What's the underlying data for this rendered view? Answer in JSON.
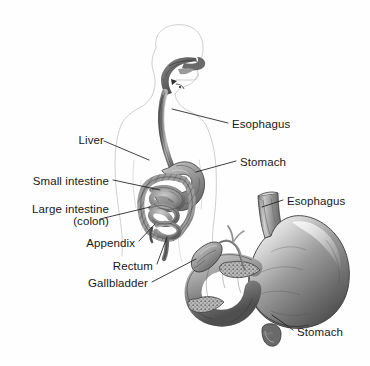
{
  "figure": {
    "background_color": "#fefefe",
    "ink_color": "#181818",
    "outline_color": "#c9c9c9",
    "width": 370,
    "height": 366,
    "signature": "Flom"
  },
  "labels": [
    {
      "id": "esophagus-upper",
      "text": "Esophagus",
      "x": 232,
      "y": 118
    },
    {
      "id": "liver",
      "text": "Liver",
      "x": 74,
      "y": 139
    },
    {
      "id": "stomach-upper",
      "text": "Stomach",
      "x": 240,
      "y": 157
    },
    {
      "id": "small-intestine",
      "text": "Small intestine",
      "x": 14,
      "y": 177
    },
    {
      "id": "large-intestine",
      "text": "Large intestine",
      "x": 13,
      "y": 205
    },
    {
      "id": "colon",
      "text": "(colon)",
      "x": 48,
      "y": 217
    },
    {
      "id": "esophagus-lower",
      "text": "Esophagus",
      "x": 287,
      "y": 196
    },
    {
      "id": "appendix",
      "text": "Appendix",
      "x": 81,
      "y": 239
    },
    {
      "id": "rectum",
      "text": "Rectum",
      "x": 116,
      "y": 263
    },
    {
      "id": "gallbladder",
      "text": "Gallbladder",
      "x": 91,
      "y": 281
    },
    {
      "id": "stomach-lower",
      "text": "Stomach",
      "x": 297,
      "y": 327
    }
  ],
  "leader_lines": [
    {
      "id": "leader-esophagus-upper",
      "from": [
        228,
        123
      ],
      "to": [
        172,
        109
      ]
    },
    {
      "id": "leader-liver",
      "from": [
        104,
        144
      ],
      "to": [
        149,
        160
      ]
    },
    {
      "id": "leader-stomach-upper",
      "from": [
        236,
        162
      ],
      "to": [
        196,
        172
      ]
    },
    {
      "id": "leader-small-intestine",
      "from": [
        113,
        182
      ],
      "to": [
        160,
        190
      ]
    },
    {
      "id": "leader-large-intestine",
      "from": [
        100,
        220
      ],
      "to": [
        150,
        208
      ]
    },
    {
      "id": "leader-esophagus-lower",
      "from": [
        283,
        201
      ],
      "to": [
        262,
        207
      ]
    },
    {
      "id": "leader-appendix",
      "from": [
        139,
        242
      ],
      "to": [
        155,
        224
      ]
    },
    {
      "id": "leader-rectum",
      "from": [
        157,
        265
      ],
      "to": [
        166,
        236
      ]
    },
    {
      "id": "leader-gallbladder",
      "from": [
        152,
        283
      ],
      "to": [
        196,
        259
      ]
    },
    {
      "id": "leader-stomach-lower",
      "from": [
        293,
        331
      ],
      "to": [
        272,
        316
      ]
    }
  ],
  "organs": [
    {
      "id": "body-outline",
      "name": "human head, neck and torso silhouette"
    },
    {
      "id": "mouth-pharynx",
      "name": "mouth and pharynx"
    },
    {
      "id": "esophagus-tube",
      "name": "esophagus tube descending through chest"
    },
    {
      "id": "stomach-small",
      "name": "stomach in body overview"
    },
    {
      "id": "small-intestine-coil",
      "name": "coiled small intestine"
    },
    {
      "id": "large-intestine-frame",
      "name": "large intestine framing the coil"
    },
    {
      "id": "appendix-tip",
      "name": "appendix"
    },
    {
      "id": "rectum-tube",
      "name": "rectum"
    },
    {
      "id": "stomach-large",
      "name": "enlarged stomach detail view"
    },
    {
      "id": "esophagus-large",
      "name": "esophagus entering enlarged stomach"
    },
    {
      "id": "gallbladder-sac",
      "name": "gallbladder"
    },
    {
      "id": "bile-duct",
      "name": "bile duct"
    },
    {
      "id": "duodenum",
      "name": "duodenum"
    },
    {
      "id": "pancreas",
      "name": "pancreas"
    }
  ]
}
